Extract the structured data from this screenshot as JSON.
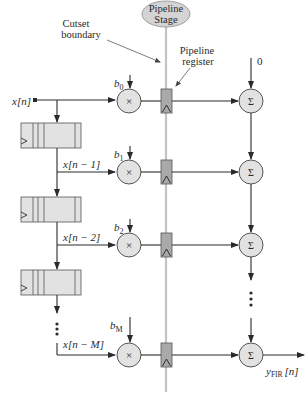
{
  "diagram": {
    "pipeline_stage": {
      "line1": "Pipeline",
      "line2": "Stage"
    },
    "cutset_label": {
      "line1": "Cutset",
      "line2": "boundary"
    },
    "pipeline_register_label": {
      "line1": "Pipeline",
      "line2": "register"
    },
    "input_label": "x[n]",
    "initial_sum_label": "0",
    "output_label": {
      "main": "y",
      "sub": "FIR",
      "suffix": "[n]"
    },
    "taps": [
      {
        "coeff": "b",
        "coeff_sub": "0",
        "signal": "x[n]"
      },
      {
        "coeff": "b",
        "coeff_sub": "1",
        "signal": "x[n − 1]"
      },
      {
        "coeff": "b",
        "coeff_sub": "2",
        "signal": "x[n − 2]"
      },
      {
        "coeff": "b",
        "coeff_sub": "M",
        "signal": "x[n − M]"
      }
    ],
    "multiplier_symbol": "×",
    "adder_symbol": "Σ",
    "ellipsis": "⋮",
    "colors": {
      "line": "#2a2a2a",
      "block_fill": "#e2e2e2",
      "register_fill": "#a9a9a9",
      "cutset_line": "#c4c4c4",
      "ellipse_fill": "#d4d4d4"
    }
  }
}
